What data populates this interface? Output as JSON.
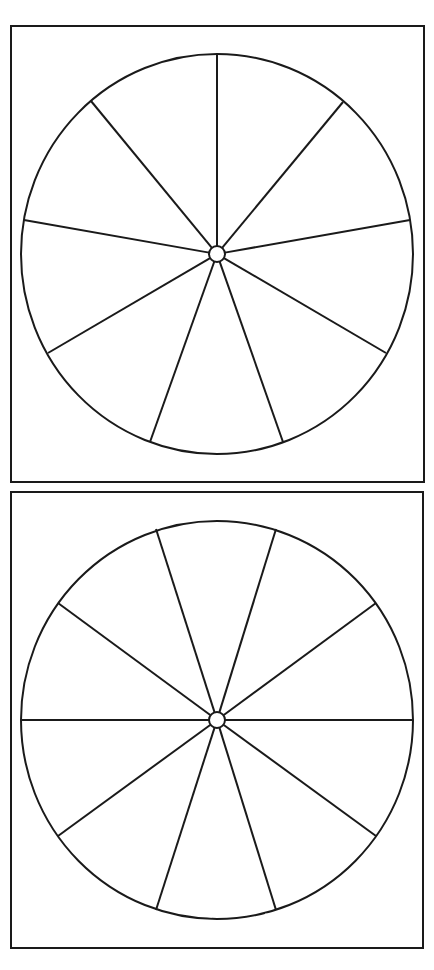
{
  "diagram": {
    "colors": {
      "stroke": "#1a1a1a",
      "background": "#ffffff",
      "fade": "#9a9a9a"
    },
    "panels": [
      {
        "name": "nine-segment-circle",
        "segments": 9,
        "frame": {
          "x": 11,
          "y": 26,
          "w": 413,
          "h": 456
        },
        "center": {
          "x": 217,
          "y": 254
        },
        "radius": {
          "rx": 196,
          "ry": 200
        },
        "hub_radius": 8,
        "spoke_ends": [
          [
            217,
            55
          ],
          [
            343,
            102
          ],
          [
            410,
            220
          ],
          [
            386,
            353
          ],
          [
            283,
            442
          ],
          [
            150,
            442
          ],
          [
            48,
            353
          ],
          [
            24,
            220
          ],
          [
            91,
            101
          ]
        ]
      },
      {
        "name": "ten-segment-circle",
        "segments": 10,
        "frame": {
          "x": 11,
          "y": 492,
          "w": 412,
          "h": 456
        },
        "center": {
          "x": 217,
          "y": 720
        },
        "radius": {
          "rx": 196,
          "ry": 199
        },
        "hub_radius": 8,
        "spoke_ends": [
          [
            156,
            529
          ],
          [
            276,
            529
          ],
          [
            376,
            603
          ],
          [
            413,
            720
          ],
          [
            376,
            836
          ],
          [
            276,
            910
          ],
          [
            156,
            910
          ],
          [
            58,
            836
          ],
          [
            21,
            720
          ],
          [
            58,
            603
          ]
        ]
      }
    ]
  }
}
